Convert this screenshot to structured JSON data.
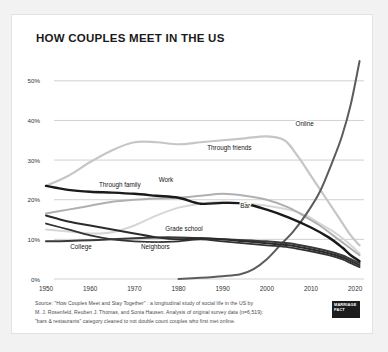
{
  "card": {
    "title": "HOW COUPLES MEET IN THE US"
  },
  "source": {
    "line1": "Source: \"How Couples Meet and Stay Together\" : a longitudinal study of social life in the US by",
    "line2": "M. J. Rosenfeld, Reuben J. Thomas, and Sonia Hausen. Analysis of original survey data (n=6,519):",
    "line3": "\"bars & restaurants\" category cleaned to not double count couples who first met online."
  },
  "logo": {
    "line1": "MARRIAGE",
    "line2": "PACT"
  },
  "chart_data": {
    "type": "line",
    "title": "HOW COUPLES MEET IN THE US",
    "xlabel": "",
    "ylabel": "",
    "xlim": [
      1950,
      2022
    ],
    "ylim": [
      0,
      55
    ],
    "grid": true,
    "legend_position": "inline-labels",
    "x_ticks": [
      "1950",
      "1960",
      "1970",
      "1980",
      "1990",
      "2000",
      "2010",
      "2020"
    ],
    "x_tick_values": [
      1950,
      1960,
      1970,
      1980,
      1990,
      2000,
      2010,
      2020
    ],
    "y_ticks": [
      "0%",
      "10%",
      "20%",
      "30%",
      "40%",
      "50%"
    ],
    "y_tick_values": [
      0,
      10,
      20,
      30,
      40,
      50
    ],
    "series": [
      {
        "name": "Online",
        "label": "Online",
        "color": "#5c5c5c",
        "width": 2.0,
        "label_x": 2006.5,
        "label_y": 38.5,
        "x": [
          1980,
          1985,
          1990,
          1994,
          1997,
          2000,
          2003,
          2006,
          2009,
          2012,
          2015,
          2017,
          2019,
          2021
        ],
        "y": [
          0.0,
          0.3,
          0.7,
          1.2,
          2.5,
          5.0,
          8.5,
          12.0,
          16.5,
          22.0,
          30.0,
          36.0,
          44.0,
          55.0
        ]
      },
      {
        "name": "Through friends",
        "label": "Through friends",
        "color": "#c6c6c6",
        "width": 2.2,
        "label_x": 1986.5,
        "label_y": 32.5,
        "x": [
          1950,
          1955,
          1960,
          1965,
          1970,
          1975,
          1980,
          1985,
          1990,
          1995,
          2000,
          2004,
          2007,
          2010,
          2013,
          2016,
          2019,
          2021
        ],
        "y": [
          23.5,
          26.0,
          29.5,
          32.5,
          34.5,
          34.5,
          34.0,
          34.5,
          35.0,
          35.5,
          36.0,
          35.0,
          31.0,
          26.0,
          21.0,
          16.0,
          11.0,
          8.5
        ]
      },
      {
        "name": "Through family",
        "label": "Through family",
        "color": "#1a1a1a",
        "width": 2.4,
        "label_x": 1962.0,
        "label_y": 23.2,
        "x": [
          1950,
          1955,
          1960,
          1965,
          1970,
          1975,
          1980,
          1985,
          1990,
          1995,
          2000,
          2005,
          2010,
          2014,
          2017,
          2019,
          2021
        ],
        "y": [
          23.5,
          22.5,
          22.0,
          21.8,
          21.5,
          21.0,
          20.5,
          19.0,
          19.2,
          19.0,
          17.5,
          15.5,
          13.0,
          10.5,
          8.0,
          6.0,
          4.5
        ]
      },
      {
        "name": "Work",
        "label": "Work",
        "color": "#b0b0b0",
        "width": 2.0,
        "label_x": 1975.5,
        "label_y": 24.5,
        "x": [
          1950,
          1955,
          1960,
          1965,
          1970,
          1975,
          1980,
          1985,
          1990,
          1995,
          2000,
          2005,
          2009,
          2012,
          2015,
          2018,
          2021
        ],
        "y": [
          16.5,
          17.5,
          18.5,
          19.5,
          20.0,
          20.3,
          20.5,
          21.0,
          21.5,
          21.0,
          20.0,
          18.0,
          15.5,
          13.5,
          11.0,
          8.5,
          6.0
        ]
      },
      {
        "name": "Bar",
        "label": "Bar",
        "color": "#d6d6d6",
        "width": 2.0,
        "label_x": 1994.0,
        "label_y": 18.0,
        "x": [
          1950,
          1955,
          1960,
          1965,
          1970,
          1975,
          1980,
          1985,
          1990,
          1995,
          2000,
          2005,
          2009,
          2012,
          2015,
          2018,
          2021
        ],
        "y": [
          12.5,
          12.0,
          11.5,
          11.8,
          13.5,
          16.0,
          18.0,
          19.0,
          19.5,
          19.0,
          18.5,
          17.5,
          16.0,
          14.0,
          12.0,
          9.5,
          6.5
        ]
      },
      {
        "name": "Grade school",
        "label": "Grade school",
        "color": "#2b2b2b",
        "width": 2.0,
        "label_x": 1977.0,
        "label_y": 12.0,
        "x": [
          1950,
          1955,
          1960,
          1965,
          1970,
          1975,
          1980,
          1985,
          1990,
          1995,
          2000,
          2005,
          2010,
          2014,
          2017,
          2019,
          2021
        ],
        "y": [
          16.0,
          14.5,
          13.5,
          12.5,
          11.5,
          10.5,
          10.0,
          10.3,
          10.0,
          9.5,
          9.0,
          8.5,
          7.5,
          6.5,
          5.5,
          4.5,
          3.5
        ]
      },
      {
        "name": "College",
        "label": "College",
        "color": "#3a3a3a",
        "width": 2.0,
        "label_x": 1955.5,
        "label_y": 7.5,
        "x": [
          1950,
          1955,
          1960,
          1965,
          1970,
          1975,
          1980,
          1985,
          1990,
          1995,
          2000,
          2005,
          2010,
          2014,
          2017,
          2019,
          2021
        ],
        "y": [
          9.5,
          9.6,
          9.8,
          10.0,
          10.3,
          10.5,
          10.5,
          10.3,
          10.0,
          9.8,
          9.5,
          9.0,
          8.0,
          7.0,
          6.0,
          5.0,
          4.0
        ]
      },
      {
        "name": "Neighbors",
        "label": "Neighbors",
        "color": "#333333",
        "width": 1.8,
        "label_x": 1971.5,
        "label_y": 7.6,
        "x": [
          1950,
          1955,
          1960,
          1965,
          1970,
          1975,
          1980,
          1985,
          1990,
          1995,
          2000,
          2005,
          2010,
          2014,
          2017,
          2019,
          2021
        ],
        "y": [
          14.0,
          12.5,
          11.0,
          10.0,
          9.5,
          9.3,
          9.5,
          10.0,
          9.5,
          9.0,
          8.5,
          8.0,
          7.0,
          6.0,
          5.0,
          4.0,
          3.0
        ]
      }
    ]
  }
}
